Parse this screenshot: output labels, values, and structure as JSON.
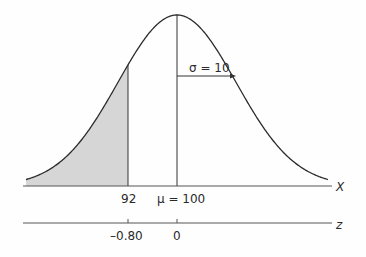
{
  "chart_data": {
    "type": "area",
    "title": "",
    "distribution": "normal",
    "mean": 100,
    "sd": 10,
    "shaded_region": {
      "from": "-inf",
      "to": 92,
      "color": "#d4d4d4"
    },
    "x_axis": {
      "label": "X",
      "ticks": [
        {
          "value": 92,
          "label": "92"
        },
        {
          "value": 100,
          "label": "μ = 100"
        }
      ]
    },
    "z_axis": {
      "label": "z",
      "ticks": [
        {
          "value": -0.8,
          "label": "–0.80"
        },
        {
          "value": 0,
          "label": "0"
        }
      ]
    },
    "annotation": {
      "text": "σ = 10",
      "arrow_from": 100,
      "arrow_to": 110
    }
  },
  "labels": {
    "sigma": "σ = 10",
    "x92": "92",
    "mu": "μ = 100",
    "x_axis": "X",
    "z_axis": "z",
    "z_neg": "–0.80",
    "z_zero": "0"
  }
}
